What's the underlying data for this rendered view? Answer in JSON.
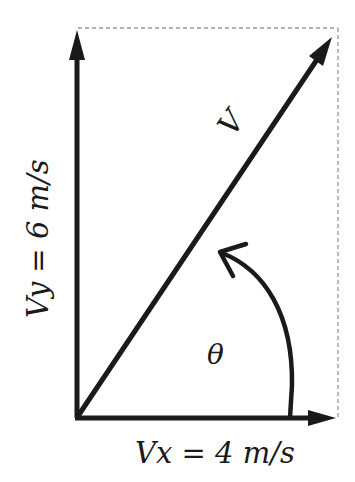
{
  "diagram": {
    "vector_label": "V",
    "angle_label": "θ",
    "vy_label": "Vy = 6 m/s",
    "vx_label": "Vx = 4 m/s",
    "vx_value": 4,
    "vy_value": 6,
    "unit": "m/s",
    "colors": {
      "ink": "#1a1a1a",
      "dashed": "#999999",
      "background": "#ffffff"
    }
  }
}
